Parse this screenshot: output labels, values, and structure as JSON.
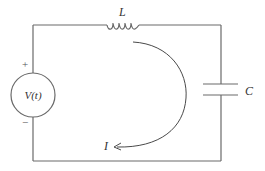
{
  "diagram": {
    "components": {
      "source": {
        "label": "V(t)",
        "plus": "+",
        "minus": "−"
      },
      "inductor": {
        "label": "L"
      },
      "capacitor": {
        "label": "C"
      },
      "current": {
        "label": "I",
        "direction": "clockwise-arc"
      }
    },
    "colors": {
      "wire": "#6a6a6a",
      "text": "#333333",
      "background": "#ffffff"
    }
  }
}
